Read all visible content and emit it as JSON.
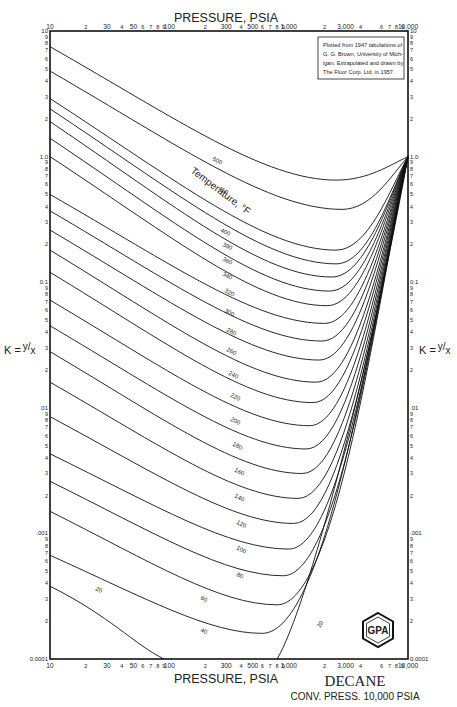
{
  "chart_data": {
    "type": "line",
    "title": "DECANE",
    "subtitle": "CONV. PRESS. 10,000 PSIA",
    "xlabel": "PRESSURE, PSIA",
    "ylabel": "K = y/x",
    "xscale": "log",
    "yscale": "log",
    "xlim": [
      10,
      10000
    ],
    "ylim": [
      0.0001,
      10
    ],
    "grid": false,
    "x_tick_labels": [
      "10",
      "2",
      "30",
      "4",
      "50",
      "6",
      "7",
      "8",
      "9",
      "100",
      "2",
      "300",
      "4",
      "500",
      "6",
      "7",
      "8",
      "9",
      "1,000",
      "2",
      "3,000",
      "4",
      "6",
      "7",
      "8",
      "9",
      "10,000"
    ],
    "x_ticks": [
      10,
      20,
      30,
      40,
      50,
      60,
      70,
      80,
      90,
      100,
      200,
      300,
      400,
      500,
      600,
      700,
      800,
      900,
      1000,
      2000,
      3000,
      4000,
      6000,
      7000,
      8000,
      9000,
      10000
    ],
    "y_tick_labels": [
      "10",
      "9",
      "8",
      "7",
      "6",
      "5",
      "4",
      "3",
      "2",
      "1.0",
      "9",
      "8",
      "7",
      "6",
      "5",
      "4",
      "3",
      "2",
      "0.1",
      "9",
      "8",
      "7",
      "6",
      "5",
      "4",
      "3",
      "2",
      ".01",
      "9",
      "8",
      "7",
      "6",
      "5",
      "4",
      "3",
      "2",
      ".001",
      "9",
      "8",
      "7",
      "6",
      "5",
      "4",
      "3",
      "2",
      "0.0001"
    ],
    "curve_family_label": "Temperature, °F",
    "convergence_point": {
      "pressure": 10000,
      "K": 1.0
    },
    "series": [
      {
        "name": "500",
        "K_at_10psia": 7.5,
        "K_min": 0.65,
        "P_at_min": 2500
      },
      {
        "name": "450",
        "K_at_10psia": 4.8,
        "K_min": 0.38,
        "P_at_min": 2800
      },
      {
        "name": "400",
        "K_at_10psia": 2.9,
        "K_min": 0.18,
        "P_at_min": 2500
      },
      {
        "name": "380",
        "K_at_10psia": 2.4,
        "K_min": 0.14,
        "P_at_min": 2500
      },
      {
        "name": "360",
        "K_at_10psia": 1.9,
        "K_min": 0.11,
        "P_at_min": 2300
      },
      {
        "name": "340",
        "K_at_10psia": 1.4,
        "K_min": 0.085,
        "P_at_min": 2200
      },
      {
        "name": "320",
        "K_at_10psia": 1.0,
        "K_min": 0.065,
        "P_at_min": 2100
      },
      {
        "name": "300",
        "K_at_10psia": 0.5,
        "K_min": 0.047,
        "P_at_min": 2000
      },
      {
        "name": "280",
        "K_at_10psia": 0.37,
        "K_min": 0.034,
        "P_at_min": 1900
      },
      {
        "name": "260",
        "K_at_10psia": 0.26,
        "K_min": 0.024,
        "P_at_min": 1800
      },
      {
        "name": "240",
        "K_at_10psia": 0.18,
        "K_min": 0.016,
        "P_at_min": 1700
      },
      {
        "name": "220",
        "K_at_10psia": 0.12,
        "K_min": 0.011,
        "P_at_min": 1600
      },
      {
        "name": "200",
        "K_at_10psia": 0.072,
        "K_min": 0.0072,
        "P_at_min": 1500
      },
      {
        "name": "180",
        "K_at_10psia": 0.045,
        "K_min": 0.0047,
        "P_at_min": 1400
      },
      {
        "name": "160",
        "K_at_10psia": 0.028,
        "K_min": 0.003,
        "P_at_min": 1300
      },
      {
        "name": "140",
        "K_at_10psia": 0.016,
        "K_min": 0.0019,
        "P_at_min": 1200
      },
      {
        "name": "120",
        "K_at_10psia": 0.0085,
        "K_min": 0.0012,
        "P_at_min": 1100
      },
      {
        "name": "100",
        "K_at_10psia": 0.0043,
        "K_min": 0.00075,
        "P_at_min": 1000
      },
      {
        "name": "80",
        "K_at_10psia": 0.0026,
        "K_min": 0.00046,
        "P_at_min": 900
      },
      {
        "name": "60",
        "K_at_10psia": 0.0015,
        "K_min": 0.00027,
        "P_at_min": 800
      },
      {
        "name": "40",
        "K_at_10psia": 0.00067,
        "K_min": 0.00016,
        "P_at_min": 600
      },
      {
        "name": "20",
        "K_at_10psia": 0.00038,
        "K_min": 0.0001,
        "P_at_min": 80
      }
    ],
    "annotations": [
      "Plotted from 1947 tabulations of G. G. Brown, University of Michigan. Extrapolated and drawn by The Fluor Corp. Ltd. in 1957."
    ]
  },
  "header": {
    "top_axis_title": "PRESSURE, PSIA"
  },
  "footer": {
    "bottom_axis_title": "PRESSURE, PSIA",
    "component_name": "DECANE",
    "convergence_pressure": "CONV. PRESS. 10,000  PSIA"
  },
  "axes": {
    "left_label": "K = y/x",
    "right_label": "K = y/x",
    "k_letter": "K =",
    "y_sym": "y",
    "x_sym": "x"
  },
  "note_box": {
    "lines": [
      "Plotted from 1947 tabulations of",
      "G. G. Brown, University of Mich-",
      "igan. Extrapolated and drawn by",
      "The Fluor Corp. Ltd. in 1957."
    ]
  },
  "logo": {
    "text": "GPA"
  },
  "temperature_label": "Temperature, °F"
}
